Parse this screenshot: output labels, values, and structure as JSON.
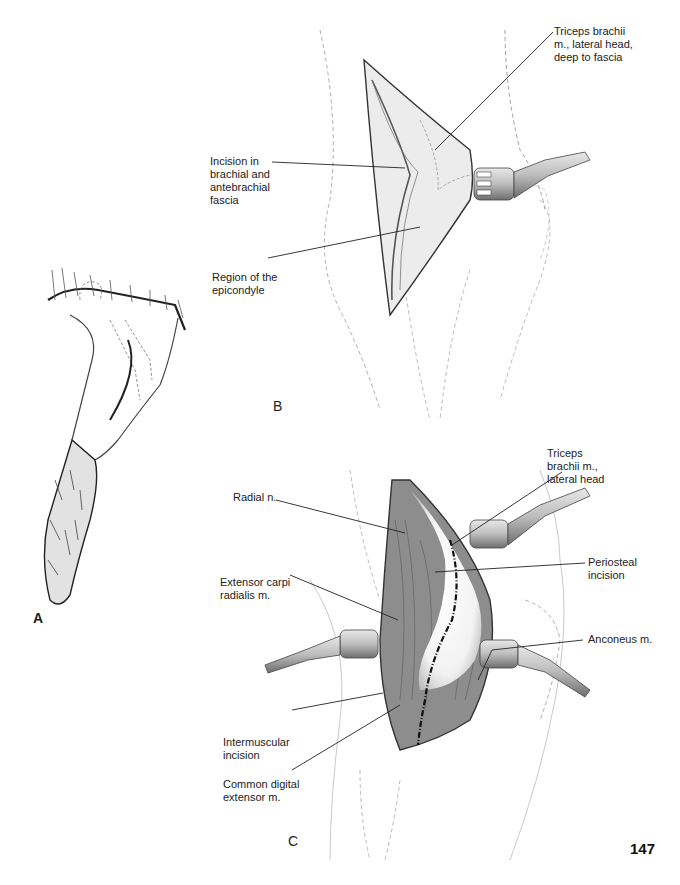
{
  "page": {
    "number": "147"
  },
  "panels": {
    "a": {
      "letter": "A"
    },
    "b": {
      "letter": "B",
      "labels": [
        {
          "id": "triceps-lateral-head-deep",
          "text": "Triceps brachii\nm., lateral head,\ndeep to fascia"
        },
        {
          "id": "incision-fascia",
          "text": "Incision in\nbrachial and\nantebrachial\nfascia"
        },
        {
          "id": "epicondyle",
          "text": "Region of the\nepicondyle"
        }
      ]
    },
    "c": {
      "letter": "C",
      "labels": [
        {
          "id": "triceps-lateral-head",
          "text": "Triceps\nbrachii m.,\nlateral head"
        },
        {
          "id": "radial-nerve",
          "text": "Radial n."
        },
        {
          "id": "periosteal-incision",
          "text": "Periosteal\nincision"
        },
        {
          "id": "extensor-carpi-radialis",
          "text": "Extensor carpi\nradialis m."
        },
        {
          "id": "anconeus",
          "text": "Anconeus m."
        },
        {
          "id": "intermuscular-incision",
          "text": "Intermuscular\nincision"
        },
        {
          "id": "common-digital-extensor",
          "text": "Common digital\nextensor m."
        }
      ]
    }
  },
  "colors": {
    "ink": "#222222",
    "tissue": "#d9d9d9",
    "muscle": "#8a8a8a",
    "retractor": "#b5b5b5"
  }
}
